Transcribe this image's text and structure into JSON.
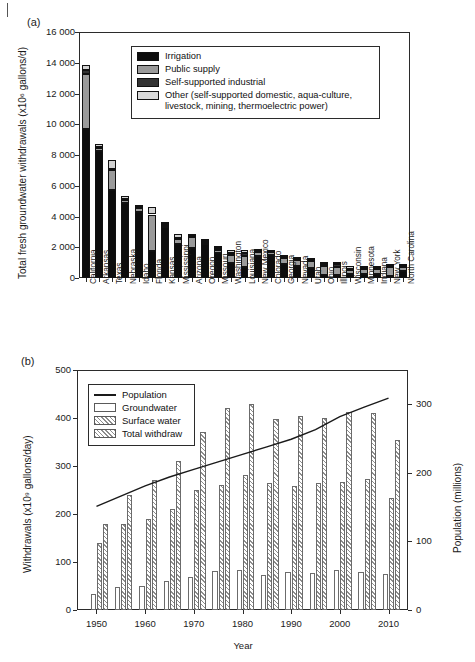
{
  "figure": {
    "panel_a_label": "(a)",
    "panel_b_label": "(b)"
  },
  "chart_data": [
    {
      "id": "panel_a",
      "type": "bar",
      "stacked": true,
      "title": "",
      "xlabel": "",
      "ylabel": "Total fresh groundwater withdrawals (x10⁶ gallons/d)",
      "ylim": [
        0,
        16000
      ],
      "yticks": [
        0,
        2000,
        4000,
        6000,
        8000,
        10000,
        12000,
        14000,
        16000
      ],
      "ytick_labels": [
        "0",
        "2 000",
        "4 000",
        "6 000",
        "8 000",
        "10 000",
        "12 000",
        "14 000",
        "16 000"
      ],
      "grid": false,
      "legend_position": "upper-center-inside",
      "legend": [
        "Irrigation",
        "Public supply",
        "Self-supported industrial",
        "Other (self-supported domestic, aqua-culture,",
        "livestock, mining, thermoelectric power)"
      ],
      "series": [
        {
          "name": "Irrigation",
          "color": "#0d0d0d",
          "values": [
            9700,
            8250,
            5750,
            4850,
            4300,
            1780,
            3300,
            2200,
            1930,
            2230,
            1600,
            1000,
            720,
            1450,
            1520,
            880,
            790,
            660,
            200,
            220,
            250,
            250,
            230,
            160,
            470
          ]
        },
        {
          "name": "Public supply",
          "color": "#9a9a9a",
          "values": [
            3600,
            200,
            1250,
            250,
            250,
            2350,
            150,
            330,
            720,
            120,
            250,
            500,
            700,
            250,
            150,
            400,
            400,
            460,
            560,
            480,
            290,
            330,
            360,
            540,
            230
          ]
        },
        {
          "name": "Self-supported industrial",
          "color": "#333333",
          "values": [
            200,
            80,
            80,
            50,
            70,
            60,
            40,
            100,
            90,
            30,
            80,
            110,
            210,
            50,
            30,
            60,
            50,
            30,
            120,
            180,
            60,
            60,
            70,
            70,
            60
          ]
        },
        {
          "name": "Other (self-supported domestic, aqua-culture, livestock, mining, thermoelectric power)",
          "color": "#d2d2d2",
          "values": [
            330,
            170,
            620,
            180,
            140,
            430,
            130,
            260,
            140,
            40,
            160,
            200,
            180,
            100,
            100,
            100,
            130,
            50,
            190,
            140,
            200,
            160,
            140,
            110,
            110
          ]
        }
      ],
      "categories": [
        "California",
        "Arkansas",
        "Texas",
        "Nebraska",
        "Idaho",
        "Florida",
        "Kansas",
        "Mississippi",
        "Arizona",
        "Oregon",
        "Missouri",
        "Washington",
        "Louisiana",
        "New Mexico",
        "Colorado",
        "Georgia",
        "Nevada",
        "Utah",
        "Ohio",
        "Illinois",
        "Wisconsin",
        "Minnesota",
        "Indiana",
        "New York",
        "North Carolina"
      ]
    },
    {
      "id": "panel_b",
      "type": "bar",
      "grouped": true,
      "title": "",
      "xlabel": "Year",
      "ylabel": "Withdrawals (x10⁹ gallons/day)",
      "y2label": "Population (millions)",
      "ylim": [
        0,
        500
      ],
      "yticks": [
        0,
        100,
        200,
        300,
        400,
        500
      ],
      "ytick_labels": [
        "0",
        "100",
        "200",
        "300",
        "400",
        "500"
      ],
      "y2lim": [
        0,
        350
      ],
      "y2ticks": [
        0,
        100,
        200,
        300
      ],
      "y2tick_labels": [
        "0",
        "100",
        "200",
        "300"
      ],
      "xlim": [
        1946,
        2014
      ],
      "xticks": [
        1950,
        1960,
        1970,
        1980,
        1990,
        2000,
        2010
      ],
      "xtick_labels": [
        "1950",
        "1960",
        "1970",
        "1980",
        "1990",
        "2000",
        "2010"
      ],
      "grid": false,
      "legend_position": "upper-left-inside",
      "legend": [
        "Population",
        "Groundwater",
        "Surface water",
        "Total withdraw"
      ],
      "categories": [
        1950,
        1955,
        1960,
        1965,
        1970,
        1975,
        1980,
        1985,
        1990,
        1995,
        2000,
        2005,
        2010
      ],
      "series": [
        {
          "name": "Groundwater",
          "values": [
            34,
            47,
            50,
            60,
            68,
            82,
            83,
            73,
            80,
            77,
            84,
            79,
            76
          ]
        },
        {
          "name": "Surface water",
          "values": [
            140,
            180,
            190,
            210,
            250,
            260,
            282,
            265,
            258,
            264,
            267,
            273,
            233
          ]
        },
        {
          "name": "Total withdraw",
          "values": [
            180,
            240,
            270,
            310,
            370,
            420,
            430,
            398,
            404,
            400,
            413,
            410,
            355
          ]
        }
      ],
      "population_series": {
        "name": "Population",
        "unit": "millions",
        "x": [
          1950,
          1955,
          1960,
          1965,
          1970,
          1975,
          1980,
          1985,
          1990,
          1995,
          2000,
          2005,
          2010
        ],
        "values": [
          151,
          166,
          181,
          194,
          205,
          216,
          227,
          238,
          249,
          263,
          282,
          296,
          309
        ]
      }
    }
  ]
}
